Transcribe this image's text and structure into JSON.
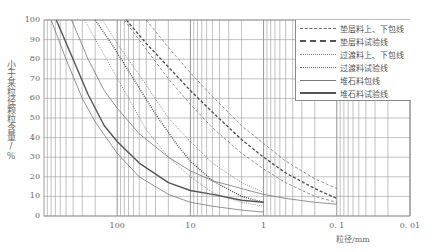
{
  "chart_data": {
    "type": "line",
    "title": "",
    "xlabel": "粒径/mm",
    "ylabel": "小于某粒径颗粒含量/%",
    "x_scale": "log",
    "x_reversed": true,
    "xlim": [
      1000,
      0.01
    ],
    "ylim": [
      0,
      100
    ],
    "x_ticks": [
      {
        "value": 100,
        "label": "100"
      },
      {
        "value": 10,
        "label": "10"
      },
      {
        "value": 1,
        "label": "1"
      },
      {
        "value": 0.1,
        "label": "0. 1"
      },
      {
        "value": 0.01,
        "label": "0. 01"
      }
    ],
    "y_ticks": [
      0,
      10,
      20,
      30,
      40,
      50,
      60,
      70,
      80,
      90,
      100
    ],
    "grid": true,
    "legend_position": "upper right",
    "legend": [
      {
        "label": "垫层料上、下包线",
        "style": "dashed",
        "weight": "thin"
      },
      {
        "label": "垫层料试验线",
        "style": "dashed",
        "weight": "thick"
      },
      {
        "label": "过渡料上、下包线",
        "style": "dotted",
        "weight": "thin"
      },
      {
        "label": "过渡料试验线",
        "style": "dotted",
        "weight": "thick"
      },
      {
        "label": "堆石料包线",
        "style": "solid",
        "weight": "thin"
      },
      {
        "label": "堆石料试验线",
        "style": "solid",
        "weight": "thick"
      }
    ],
    "series": [
      {
        "name": "垫层料上包线",
        "style": "dashed",
        "weight": "thin",
        "x": [
          40,
          20,
          10,
          5,
          2,
          1,
          0.5,
          0.2,
          0.1
        ],
        "y": [
          100,
          86,
          73,
          61,
          46,
          37,
          28,
          19,
          14
        ]
      },
      {
        "name": "垫层料下包线",
        "style": "dashed",
        "weight": "thin",
        "x": [
          80,
          40,
          20,
          10,
          5,
          2,
          1,
          0.5,
          0.2,
          0.1
        ],
        "y": [
          100,
          85,
          70,
          57,
          45,
          32,
          24,
          17,
          10,
          7
        ]
      },
      {
        "name": "垫层料试验线",
        "style": "dashed",
        "weight": "thick",
        "x": [
          75,
          40,
          20,
          10,
          5,
          2,
          1,
          0.5,
          0.2,
          0.1
        ],
        "y": [
          100,
          88,
          76,
          64,
          53,
          39,
          30,
          22,
          14,
          9
        ]
      },
      {
        "name": "过渡料上包线",
        "style": "dotted",
        "weight": "thin",
        "x": [
          160,
          100,
          50,
          20,
          10,
          5,
          2,
          1
        ],
        "y": [
          100,
          88,
          72,
          50,
          38,
          27,
          17,
          12
        ]
      },
      {
        "name": "过渡料下包线",
        "style": "dotted",
        "weight": "thin",
        "x": [
          280,
          150,
          80,
          40,
          20,
          10,
          5,
          2,
          1
        ],
        "y": [
          100,
          82,
          64,
          44,
          30,
          20,
          12,
          7,
          5
        ]
      },
      {
        "name": "过渡料试验线",
        "style": "dotted",
        "weight": "thick",
        "x": [
          200,
          120,
          60,
          30,
          15,
          10,
          5,
          2,
          1
        ],
        "y": [
          100,
          88,
          70,
          52,
          36,
          28,
          18,
          10,
          7
        ]
      },
      {
        "name": "堆石料上包线",
        "style": "solid",
        "weight": "thin",
        "x": [
          420,
          250,
          150,
          100,
          50,
          20,
          10,
          5,
          2,
          1,
          0.5,
          0.2,
          0.1
        ],
        "y": [
          100,
          80,
          64,
          55,
          42,
          30,
          23,
          18,
          14,
          11,
          9,
          7,
          6
        ]
      },
      {
        "name": "堆石料下包线",
        "style": "solid",
        "weight": "thin",
        "x": [
          800,
          500,
          300,
          200,
          100,
          50,
          20,
          10,
          5,
          2,
          1
        ],
        "y": [
          100,
          80,
          60,
          48,
          32,
          20,
          11,
          7,
          5,
          3,
          2
        ]
      },
      {
        "name": "堆石料试验线",
        "style": "solid",
        "weight": "thick",
        "x": [
          680,
          400,
          250,
          150,
          100,
          50,
          20,
          10,
          5,
          2,
          1
        ],
        "y": [
          100,
          80,
          62,
          46,
          38,
          27,
          17,
          13,
          11,
          8,
          7
        ]
      }
    ]
  }
}
